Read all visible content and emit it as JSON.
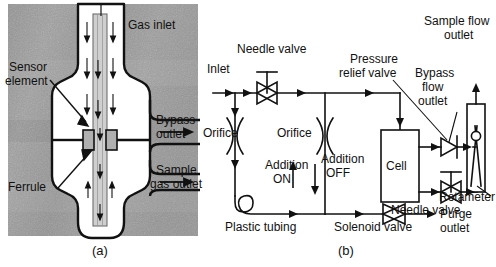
{
  "figure": {
    "caption_a": "(a)",
    "caption_b": "(b)",
    "panel_a_name": "sensor-probe-cross-section",
    "panel_b_name": "gas-flow-schematic"
  },
  "panel_a": {
    "labels": {
      "gas_inlet": "Gas inlet",
      "sensor_element_line1": "Sensor",
      "sensor_element_line2": "element",
      "bypass_outlet_line1": "Bypass",
      "bypass_outlet_line2": "outlet",
      "sample_gas_outlet_line1": "Sample",
      "sample_gas_outlet_line2": "gas outlet",
      "ferrule": "Ferrule"
    }
  },
  "panel_b": {
    "labels": {
      "inlet": "Inlet",
      "needle_valve_top": "Needle valve",
      "orifice_left": "Orifice",
      "orifice_mid": "Orifice",
      "addition_on_line1": "Addition",
      "addition_on_line2": "ON",
      "addition_off_line1": "Addition",
      "addition_off_line2": "OFF",
      "plastic_tubing": "Plastic tubing",
      "solenoid_valve": "Solenoid valve",
      "purge_outlet": "Purge outlet",
      "pressure_relief_valve_line1": "Pressure",
      "pressure_relief_valve_line2": "relief valve",
      "cell": "Cell",
      "bypass_flow_outlet_line1": "Bypass",
      "bypass_flow_outlet_line2": "flow",
      "bypass_flow_outlet_line3": "outlet",
      "sample_flow_outlet_line1": "Sample flow",
      "sample_flow_outlet_line2": "outlet",
      "needle_valve_bottom": "Needle valve",
      "rotameter": "Rotameter"
    }
  },
  "colors": {
    "ink": "#111111",
    "photo_dark": "#7a7a7a",
    "photo_light": "#b9b9b9",
    "tube_fill": "#ffffff",
    "element_fill": "#c9c9c9"
  }
}
